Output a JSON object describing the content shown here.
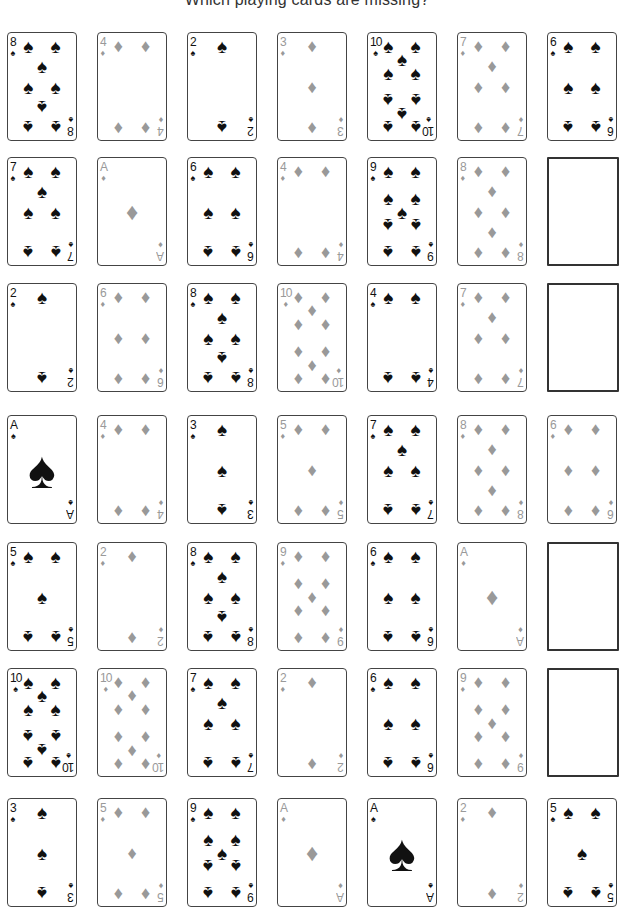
{
  "title": "Which playing cards are missing?",
  "colors": {
    "spade": "#111111",
    "diamond": "#999999",
    "border": "#444444"
  },
  "grid": {
    "columns_x": [
      7,
      97,
      187,
      277,
      367,
      457,
      547
    ],
    "rows_y": [
      32,
      157,
      283,
      415,
      542,
      668,
      798
    ]
  },
  "rows": [
    [
      {
        "rank": "8",
        "suit": "spades"
      },
      {
        "rank": "4",
        "suit": "diamonds"
      },
      {
        "rank": "2",
        "suit": "spades"
      },
      {
        "rank": "3",
        "suit": "diamonds"
      },
      {
        "rank": "10",
        "suit": "spades"
      },
      {
        "rank": "7",
        "suit": "diamonds"
      },
      {
        "rank": "6",
        "suit": "spades"
      }
    ],
    [
      {
        "rank": "7",
        "suit": "spades"
      },
      {
        "rank": "A",
        "suit": "diamonds"
      },
      {
        "rank": "6",
        "suit": "spades"
      },
      {
        "rank": "4",
        "suit": "diamonds"
      },
      {
        "rank": "9",
        "suit": "spades"
      },
      {
        "rank": "8",
        "suit": "diamonds"
      },
      {
        "blank": true
      }
    ],
    [
      {
        "rank": "2",
        "suit": "spades"
      },
      {
        "rank": "6",
        "suit": "diamonds"
      },
      {
        "rank": "8",
        "suit": "spades"
      },
      {
        "rank": "10",
        "suit": "diamonds"
      },
      {
        "rank": "4",
        "suit": "spades"
      },
      {
        "rank": "7",
        "suit": "diamonds"
      },
      {
        "blank": true
      }
    ],
    [
      {
        "rank": "A",
        "suit": "spades"
      },
      {
        "rank": "4",
        "suit": "diamonds"
      },
      {
        "rank": "3",
        "suit": "spades"
      },
      {
        "rank": "5",
        "suit": "diamonds"
      },
      {
        "rank": "7",
        "suit": "spades"
      },
      {
        "rank": "8",
        "suit": "diamonds"
      },
      {
        "rank": "6",
        "suit": "diamonds"
      }
    ],
    [
      {
        "rank": "5",
        "suit": "spades"
      },
      {
        "rank": "2",
        "suit": "diamonds"
      },
      {
        "rank": "8",
        "suit": "spades"
      },
      {
        "rank": "9",
        "suit": "diamonds"
      },
      {
        "rank": "6",
        "suit": "spades"
      },
      {
        "rank": "A",
        "suit": "diamonds"
      },
      {
        "blank": true
      }
    ],
    [
      {
        "rank": "10",
        "suit": "spades"
      },
      {
        "rank": "10",
        "suit": "diamonds"
      },
      {
        "rank": "7",
        "suit": "spades"
      },
      {
        "rank": "2",
        "suit": "diamonds"
      },
      {
        "rank": "6",
        "suit": "spades"
      },
      {
        "rank": "9",
        "suit": "diamonds"
      },
      {
        "blank": true
      }
    ],
    [
      {
        "rank": "3",
        "suit": "spades"
      },
      {
        "rank": "5",
        "suit": "diamonds"
      },
      {
        "rank": "9",
        "suit": "spades"
      },
      {
        "rank": "A",
        "suit": "diamonds"
      },
      {
        "rank": "A",
        "suit": "spades"
      },
      {
        "rank": "2",
        "suit": "diamonds"
      },
      {
        "rank": "5",
        "suit": "spades"
      }
    ]
  ],
  "icons": {
    "spades": "♠",
    "diamonds": "♦"
  }
}
